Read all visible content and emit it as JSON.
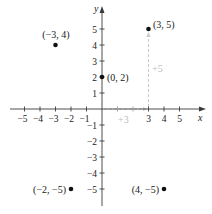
{
  "diagram": {
    "type": "cartesian-plane",
    "axes": {
      "x_label": "x",
      "y_label": "y",
      "x_range": [
        -5,
        5
      ],
      "y_range": [
        -5,
        5
      ],
      "x_ticks": [
        "−5",
        "−4",
        "−3",
        "−2",
        "−1",
        "3",
        "4",
        "5"
      ],
      "y_ticks": [
        "5",
        "4",
        "3",
        "2",
        "1",
        "−1",
        "−2",
        "−3",
        "−4",
        "−5"
      ]
    },
    "points": [
      {
        "label": "(3, 5)",
        "x": 3,
        "y": 5
      },
      {
        "label": "(−3, 4)",
        "x": -3,
        "y": 4
      },
      {
        "label": "(0, 2)",
        "x": 0,
        "y": 2
      },
      {
        "label": "(−2, −5)",
        "x": -2,
        "y": -5
      },
      {
        "label": "(4, −5)",
        "x": 4,
        "y": -5
      }
    ],
    "annotations": {
      "horizontal_move": "+3",
      "vertical_move": "+5"
    },
    "colors": {
      "axis": "#3a3a3a",
      "point": "#111111",
      "guide": "#c8c8c8"
    }
  }
}
